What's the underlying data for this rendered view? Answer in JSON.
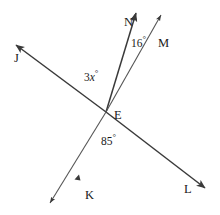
{
  "figure": {
    "type": "geometry-diagram",
    "background_color": "#ffffff",
    "stroke_color": "#3a3a3a",
    "label_color": "#1a1a1a"
  },
  "vertex": {
    "label": "E",
    "x": 106,
    "y": 112
  },
  "points": [
    {
      "id": "N",
      "label": "N",
      "x": 124,
      "y": 16,
      "ray_tip_x": 137,
      "ray_tip_y": 9
    },
    {
      "id": "M",
      "label": "M",
      "x": 158,
      "y": 37,
      "ray_tip_x": 164,
      "ray_tip_y": 11
    },
    {
      "id": "J",
      "label": "J",
      "x": 14,
      "y": 52,
      "ray_tip_x": 12,
      "ray_tip_y": 42
    },
    {
      "id": "K",
      "label": "K",
      "x": 85,
      "y": 189,
      "ray_tip_x": 47,
      "ray_tip_y": 206
    },
    {
      "id": "L",
      "label": "L",
      "x": 184,
      "y": 183,
      "ray_tip_x": 209,
      "ray_tip_y": 191
    }
  ],
  "angles": [
    {
      "id": "angle-nem",
      "label": "16",
      "unit": "°",
      "x": 131,
      "y": 38,
      "value": 16
    },
    {
      "id": "angle-jen",
      "label": "3x",
      "unit": "°",
      "x": 84,
      "y": 72,
      "value": "3x",
      "italic_var": "x"
    },
    {
      "id": "angle-kel",
      "label": "85",
      "unit": "°",
      "x": 101,
      "y": 136,
      "value": 85
    }
  ],
  "segments": [
    {
      "id": "line-jl",
      "from": "J",
      "to": "L",
      "through": "E",
      "arrows": "both"
    },
    {
      "id": "ray-en",
      "from": "E",
      "to": "N",
      "arrows": "end"
    },
    {
      "id": "ray-em",
      "from": "E",
      "to": "M",
      "arrows": "end"
    },
    {
      "id": "ray-ek",
      "from": "E",
      "to": "K",
      "arrows": "end"
    }
  ]
}
